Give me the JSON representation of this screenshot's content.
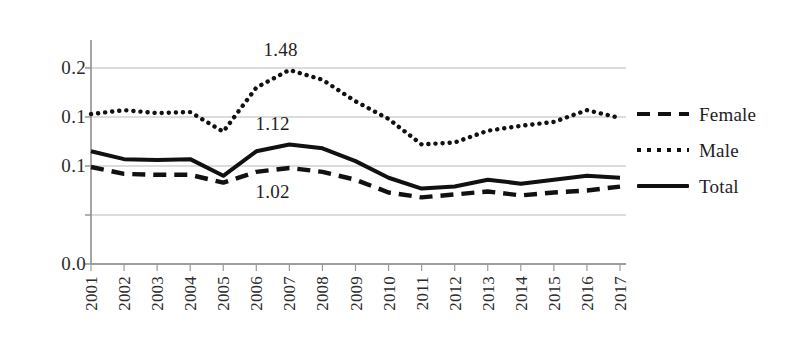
{
  "chart_data": {
    "type": "line",
    "title": "",
    "xlabel": "",
    "ylabel": "",
    "grid": true,
    "legend_position": "right",
    "x": [
      "2001",
      "2002",
      "2003",
      "2004",
      "2005",
      "2006",
      "2007",
      "2008",
      "2009",
      "2010",
      "2011",
      "2012",
      "2013",
      "2014",
      "2015",
      "2016",
      "2017"
    ],
    "categories": [
      "2001",
      "2002",
      "2003",
      "2004",
      "2005",
      "2006",
      "2007",
      "2008",
      "2009",
      "2010",
      "2011",
      "2012",
      "2013",
      "2014",
      "2015",
      "2016",
      "2017"
    ],
    "ylim": [
      0.0,
      0.2
    ],
    "ytick_values": [
      0.2,
      0.1,
      0.1,
      0.0
    ],
    "ytick_labels": [
      "0.2",
      "0.1",
      "0.1",
      "0.0"
    ],
    "series": [
      {
        "name": "Female",
        "style": "dashed",
        "color": "#111111",
        "values": [
          0.099,
          0.092,
          0.091,
          0.091,
          0.083,
          0.094,
          0.098,
          0.094,
          0.086,
          0.073,
          0.068,
          0.071,
          0.074,
          0.07,
          0.073,
          0.075,
          0.079
        ]
      },
      {
        "name": "Male",
        "style": "dotted",
        "color": "#111111",
        "values": [
          0.153,
          0.157,
          0.154,
          0.155,
          0.135,
          0.18,
          0.198,
          0.188,
          0.166,
          0.148,
          0.122,
          0.124,
          0.136,
          0.141,
          0.145,
          0.157,
          0.149
        ]
      },
      {
        "name": "Total",
        "style": "solid",
        "color": "#111111",
        "values": [
          0.115,
          0.107,
          0.106,
          0.107,
          0.09,
          0.115,
          0.122,
          0.118,
          0.105,
          0.088,
          0.077,
          0.079,
          0.086,
          0.082,
          0.086,
          0.09,
          0.088
        ]
      }
    ],
    "annotations": [
      {
        "text": "1.48",
        "series": "Male",
        "x": "2007",
        "value": 0.198
      },
      {
        "text": "1.12",
        "series": "Total",
        "x": "2007",
        "value": 0.122
      },
      {
        "text": "1.02",
        "series": "Female",
        "x": "2007",
        "value": 0.098
      }
    ]
  },
  "legend": {
    "items": [
      {
        "label": "Female",
        "key": "dashed-line-key"
      },
      {
        "label": "Male",
        "key": "dotted-line-key"
      },
      {
        "label": "Total",
        "key": "solid-line-key"
      }
    ]
  }
}
